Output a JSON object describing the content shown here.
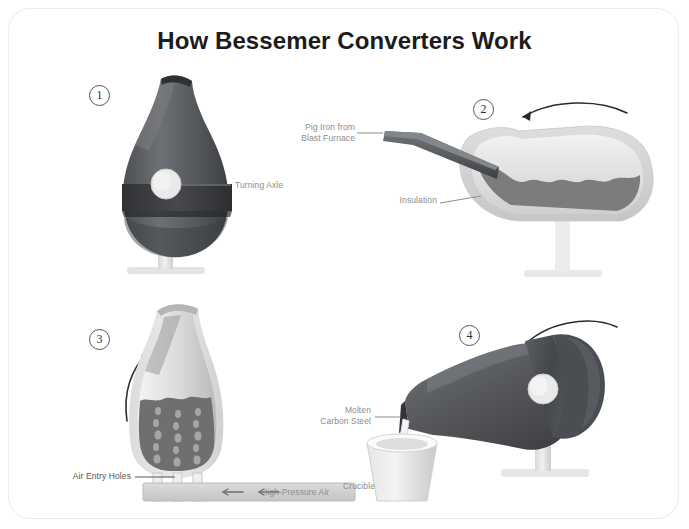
{
  "title": "How Bessemer Converters Work",
  "colors": {
    "card_border": "#ececec",
    "background": "#ffffff",
    "title_text": "#1c1c1c",
    "label_text": "#8c8c8c",
    "vessel_dark": "#5f6063",
    "vessel_darker": "#3f4144",
    "vessel_light_shell": "#d8d8d8",
    "molten_metal": "#7c7c7c",
    "stand_light": "#e2e2e2",
    "arrow": "#2b2b2b",
    "leader_line": "#8c8c8c"
  },
  "panels": [
    {
      "number": "1",
      "name": "upright-converter",
      "labels": [
        {
          "name": "turning-axle",
          "text": "Turning Axle"
        }
      ],
      "arrow": null
    },
    {
      "number": "2",
      "name": "charging-converter",
      "labels": [
        {
          "name": "pig-iron-source",
          "text": "Pig Iron from\nBlast Furnace"
        },
        {
          "name": "insulation",
          "text": "Insulation"
        }
      ],
      "arrow": {
        "direction": "left",
        "name": "rotate-left-arrow"
      }
    },
    {
      "number": "3",
      "name": "blowing-converter",
      "labels": [
        {
          "name": "air-entry-holes",
          "text": "Air Entry Holes"
        },
        {
          "name": "high-pressure-air",
          "text": "High-Pressure Air"
        }
      ],
      "arrow": {
        "direction": "up",
        "name": "rotate-up-arrow"
      },
      "duct_arrows": 2
    },
    {
      "number": "4",
      "name": "pouring-converter",
      "labels": [
        {
          "name": "molten-carbon-steel",
          "text": "Molten\nCarbon Steel"
        },
        {
          "name": "crucible",
          "text": "Crucible"
        }
      ],
      "arrow": {
        "direction": "down-left",
        "name": "rotate-down-arrow"
      }
    }
  ]
}
